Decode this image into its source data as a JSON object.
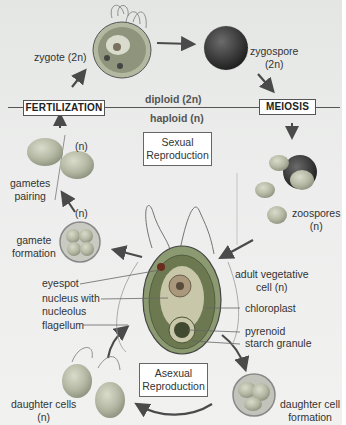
{
  "ploidy_divider": {
    "above": "diploid (2n)",
    "below": "haploid (n)"
  },
  "stage_boxes": {
    "fertilization": "FERTILIZATION",
    "meiosis": "MEIOSIS"
  },
  "cycle_boxes": {
    "sexual_line1": "Sexual",
    "sexual_line2": "Reproduction",
    "asexual_line1": "Asexual",
    "asexual_line2": "Reproduction"
  },
  "stages": {
    "zygote": "zygote (2n)",
    "zygospore_line1": "zygospore",
    "zygospore_line2": "(2n)",
    "zoospores_line1": "zoospores",
    "zoospores_line2": "(n)",
    "adult_line1": "adult vegetative",
    "adult_line2": "cell (n)",
    "gametes_pairing_n": "(n)",
    "gametes_pairing_line1": "gametes",
    "gametes_pairing_line2": "pairing",
    "gamete_formation_n": "(n)",
    "gamete_formation_line1": "gamete",
    "gamete_formation_line2": "formation",
    "daughter_cells_line1": "daughter cells",
    "daughter_cells_line2": "(n)",
    "daughter_formation_line1": "daughter cell",
    "daughter_formation_line2": "formation"
  },
  "cell_parts": {
    "eyespot": "eyespot",
    "nucleus_line1": "nucleus with",
    "nucleus_line2": "nucleolus",
    "flagellum": "flagellum",
    "chloroplast": "chloroplast",
    "pyrenoid": "pyrenoid",
    "starch": "starch granule"
  },
  "colors": {
    "background": "#eaebea",
    "cell_green": "#8f9e6a",
    "chloroplast_dark": "#5d6b45",
    "arrow": "#4a4a4a"
  }
}
